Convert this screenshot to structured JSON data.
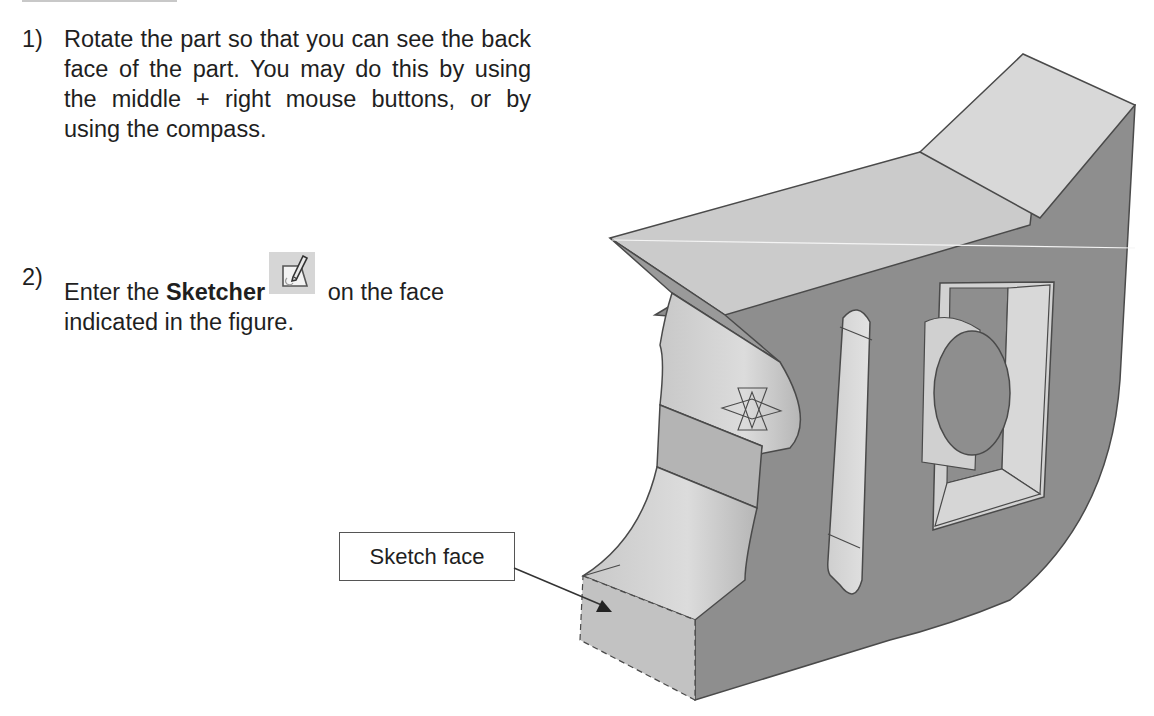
{
  "steps": [
    {
      "number": "1)",
      "text": "Rotate the part so that you can see the back face of the part.  You may do this by using the middle + right mouse buttons, or by using the compass."
    },
    {
      "number": "2)",
      "text_before": "Enter the ",
      "bold": "Sketcher",
      "text_after": " on the face indicated in the figure.",
      "icon": "sketcher-icon"
    }
  ],
  "figure": {
    "callout_label": "Sketch face",
    "icons": [
      "sketch-plane-axis-icon",
      "arrow-icon"
    ],
    "colors": {
      "light_face": "#d2d2d2",
      "mid_face": "#bdbdbd",
      "dark_face": "#8e8e8e",
      "edge": "#4a4a4a"
    }
  }
}
